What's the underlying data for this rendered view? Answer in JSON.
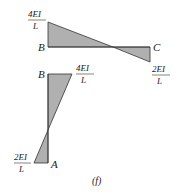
{
  "figure": {
    "caption": "(f)",
    "fill_color": "#b0b0b0",
    "stroke_color": "#333333",
    "beam_bc": {
      "left_label": "B",
      "right_label": "C",
      "left_moment": {
        "num": "4EI",
        "den": "L"
      },
      "right_moment": {
        "num": "2EI",
        "den": "L"
      }
    },
    "column_ab": {
      "top_label": "B",
      "bottom_label": "A",
      "top_moment": {
        "num": "4EI",
        "den": "L"
      },
      "bottom_moment": {
        "num": "2EI",
        "den": "L"
      }
    }
  }
}
